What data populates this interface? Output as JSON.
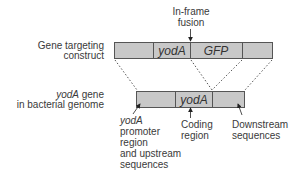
{
  "diagram": {
    "colors": {
      "bar_fill": "#c8c8c8",
      "bar_stroke": "#555555",
      "text": "#3a3a3a",
      "background": "#ffffff"
    },
    "fusion_label": {
      "line1": "In-frame",
      "line2": "fusion"
    },
    "construct": {
      "label_line1": "Gene targeting",
      "label_line2": "construct",
      "segments": [
        "",
        "yodA",
        "GFP",
        ""
      ]
    },
    "genome": {
      "label_italic": "yodA",
      "label_rest": " gene",
      "label_line2": "in bacterial genome",
      "segments": [
        "",
        "yodA",
        ""
      ]
    },
    "annotations": {
      "promoter": {
        "line1": "yodA",
        "line2": "promoter",
        "line3": "region",
        "line4": "and upstream",
        "line5": "sequences"
      },
      "coding": {
        "line1": "Coding",
        "line2": "region"
      },
      "downstream": {
        "line1": "Downstream",
        "line2": "sequences"
      }
    }
  }
}
